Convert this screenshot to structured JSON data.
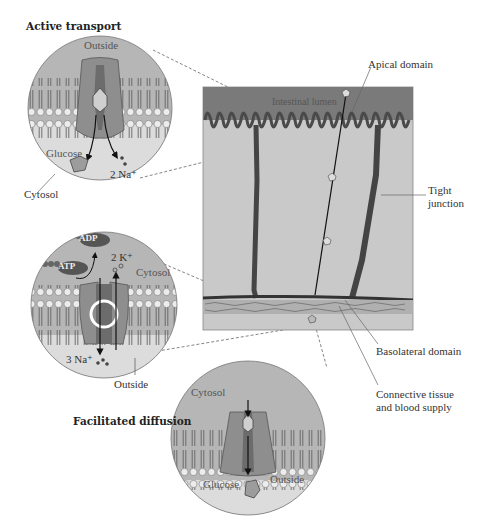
{
  "titles": {
    "active_transport": "Active transport",
    "facilitated_diffusion": "Facilitated diffusion"
  },
  "panel": {
    "intestinal_lumen": "Intestinal lumen",
    "apical_domain": "Apical domain",
    "tight_junction_line1": "Tight",
    "tight_junction_line2": "junction",
    "basolateral_domain": "Basolateral domain",
    "connective_line1": "Connective tissue",
    "connective_line2": "and blood supply"
  },
  "circle1": {
    "outside": "Outside",
    "glucose": "Glucose",
    "sodium": "2 Na⁺",
    "cytosol": "Cytosol"
  },
  "circle2": {
    "adp": "ADP",
    "atp": "ATP",
    "potassium": "2 K⁺",
    "cytosol": "Cytosol",
    "sodium": "3 Na⁺",
    "outside": "Outside"
  },
  "circle3": {
    "cytosol": "Cytosol",
    "glucose": "Glucose",
    "outside": "Outside"
  },
  "colors": {
    "lumen": "#7a7a7a",
    "cell": "#c9c9c9",
    "membrane_head": "#e8e8e8",
    "protein": "#8c8c8c",
    "circle_top": "#b4b4b4",
    "circle_bottom": "#dcdcdc"
  }
}
